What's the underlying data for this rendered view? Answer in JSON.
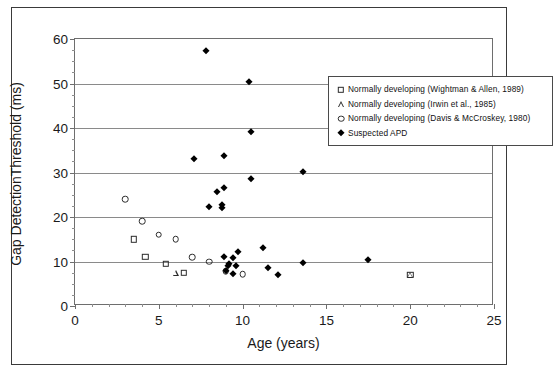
{
  "chart_data": {
    "type": "scatter",
    "title": "",
    "xlabel": "Age (years)",
    "ylabel": "Gap DetectionThreshold (ms)",
    "xlim": [
      0,
      25
    ],
    "ylim": [
      0,
      60
    ],
    "xticks": [
      0,
      5,
      10,
      15,
      20,
      25
    ],
    "yticks": [
      0,
      10,
      20,
      30,
      40,
      50,
      60
    ],
    "x_minor_tick_interval": 1,
    "y_minor_tick_interval": 2.5,
    "grid": "horizontal-major",
    "legend_position": "top-right-inside",
    "series": [
      {
        "name": "Normally developing (Wightman & Allen, 1989)",
        "marker": "open-square",
        "points": [
          {
            "x": 3.5,
            "y": 15.0
          },
          {
            "x": 4.2,
            "y": 11.0
          },
          {
            "x": 5.4,
            "y": 9.5
          },
          {
            "x": 6.5,
            "y": 7.5
          },
          {
            "x": 20.0,
            "y": 7.0
          }
        ]
      },
      {
        "name": "Normally developing (Irwin et al., 1985)",
        "marker": "open-triangle",
        "points": [
          {
            "x": 6.0,
            "y": 7.5
          },
          {
            "x": 20.0,
            "y": 7.0
          }
        ]
      },
      {
        "name": "Normally developing (Davis & McCroskey, 1980)",
        "marker": "open-circle",
        "points": [
          {
            "x": 3.0,
            "y": 24.0
          },
          {
            "x": 4.0,
            "y": 19.0
          },
          {
            "x": 5.0,
            "y": 16.0
          },
          {
            "x": 6.0,
            "y": 15.0
          },
          {
            "x": 7.0,
            "y": 11.0
          },
          {
            "x": 8.0,
            "y": 10.0
          },
          {
            "x": 9.0,
            "y": 7.8
          },
          {
            "x": 10.0,
            "y": 7.2
          }
        ]
      },
      {
        "name": "Suspected APD",
        "marker": "filled-diamond",
        "points": [
          {
            "x": 7.8,
            "y": 57.2
          },
          {
            "x": 10.4,
            "y": 50.3
          },
          {
            "x": 10.5,
            "y": 39.2
          },
          {
            "x": 8.9,
            "y": 33.8
          },
          {
            "x": 7.1,
            "y": 33.1
          },
          {
            "x": 13.6,
            "y": 30.1
          },
          {
            "x": 10.5,
            "y": 28.5
          },
          {
            "x": 8.9,
            "y": 26.6
          },
          {
            "x": 8.5,
            "y": 25.6
          },
          {
            "x": 8.8,
            "y": 22.8
          },
          {
            "x": 8.0,
            "y": 22.3
          },
          {
            "x": 8.8,
            "y": 22.0
          },
          {
            "x": 11.2,
            "y": 13.0
          },
          {
            "x": 9.7,
            "y": 12.1
          },
          {
            "x": 8.9,
            "y": 10.9
          },
          {
            "x": 17.5,
            "y": 10.4
          },
          {
            "x": 9.4,
            "y": 10.7
          },
          {
            "x": 13.6,
            "y": 9.6
          },
          {
            "x": 9.2,
            "y": 9.5
          },
          {
            "x": 9.6,
            "y": 9.0
          },
          {
            "x": 9.1,
            "y": 8.9
          },
          {
            "x": 11.5,
            "y": 8.5
          },
          {
            "x": 9.0,
            "y": 7.8
          },
          {
            "x": 9.4,
            "y": 7.1
          },
          {
            "x": 12.1,
            "y": 7.0
          }
        ]
      }
    ]
  },
  "axes": {
    "y_title": "Gap DetectionThreshold (ms)",
    "x_title": "Age (years)",
    "y_tick_labels": [
      "0",
      "10",
      "20",
      "30",
      "40",
      "50",
      "60"
    ],
    "x_tick_labels": [
      "0",
      "5",
      "10",
      "15",
      "20",
      "25"
    ]
  },
  "legend": {
    "entries": [
      {
        "symbol": "open-square-icon",
        "label": "Normally developing (Wightman & Allen, 1989)"
      },
      {
        "symbol": "open-triangle-icon",
        "label": "Normally developing (Irwin et al., 1985)"
      },
      {
        "symbol": "open-circle-icon",
        "label": "Normally developing (Davis & McCroskey, 1980)"
      },
      {
        "symbol": "filled-diamond-icon",
        "label": "Suspected APD"
      }
    ]
  },
  "colors": {
    "marker_fill": "#000000",
    "marker_stroke": "#2b2b2b",
    "gridline": "#8a8a8a",
    "axis": "#6e6e6e",
    "frame": "#3a3a3a",
    "background": "#ffffff"
  }
}
